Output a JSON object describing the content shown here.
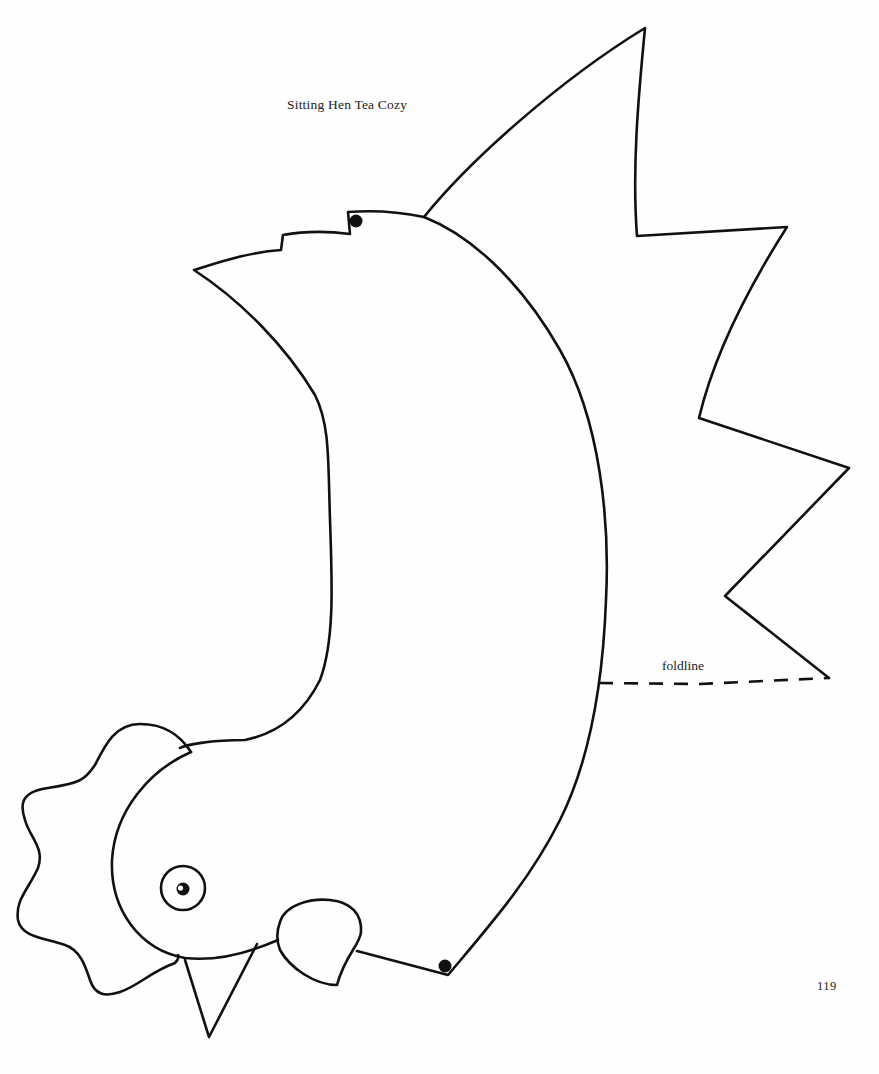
{
  "page": {
    "title": "Sitting Hen Tea Cozy",
    "page_number": "119"
  },
  "pattern": {
    "name": "sitting-hen-pattern",
    "labels": {
      "foldline": "foldline"
    },
    "parts": [
      "body",
      "tail",
      "comb",
      "head",
      "eye",
      "beak",
      "wattle"
    ],
    "markers": [
      "dot-top",
      "dot-bottom"
    ],
    "colors": {
      "line": "#111111",
      "paper": "#fefefe"
    }
  }
}
